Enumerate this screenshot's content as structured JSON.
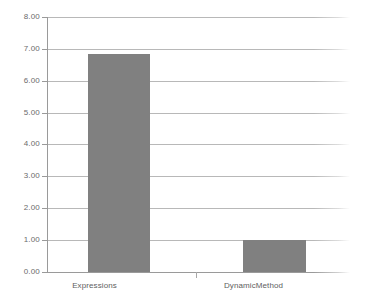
{
  "chart_data": {
    "type": "bar",
    "title": "",
    "subtitle": "",
    "xlabel": "",
    "ylabel": "",
    "categories": [
      "Expressions",
      "DynamicMethod"
    ],
    "values": [
      6.85,
      1.0
    ],
    "series": [
      {
        "name": "",
        "values": [
          6.85,
          1.0
        ],
        "color": "#808080"
      }
    ],
    "ylim": [
      0,
      8
    ],
    "ytick_step": 1,
    "ytick_labels": [
      "0.00",
      "1.00",
      "2.00",
      "3.00",
      "4.00",
      "5.00",
      "6.00",
      "7.00",
      "8.00"
    ],
    "ytick_values": [
      0,
      1,
      2,
      3,
      4,
      5,
      6,
      7,
      8
    ],
    "grid": true,
    "grid_axis": "y",
    "legend": false,
    "legend_position": "none",
    "annotations": [],
    "colors": {
      "bar_fill": "#808080",
      "gridline": "#b8b8b8",
      "axis_line": "#9a9a9a",
      "tick_label": "#6b6b6b",
      "category_label": "#5e5e5e",
      "background": "#ffffff"
    }
  }
}
